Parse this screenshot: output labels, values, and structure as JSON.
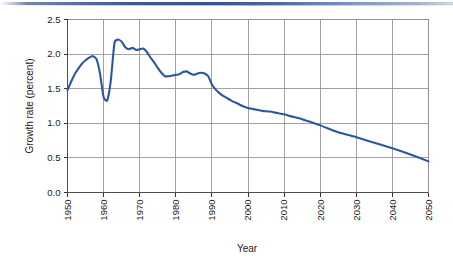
{
  "figure": {
    "background_color": "#ffffff",
    "top_rule_color": "#2f5490",
    "line_color": "#2b57a0",
    "grid_color": "#8c8c8c",
    "axis_color": "#4d4d4d"
  },
  "chart_data": {
    "type": "line",
    "title": "",
    "xlabel": "Year",
    "ylabel": "Growth rate (percent)",
    "xlim": [
      1950,
      2050
    ],
    "ylim": [
      0.0,
      2.5
    ],
    "grid": true,
    "legend": "none",
    "xticks": [
      1950,
      1960,
      1970,
      1980,
      1990,
      2000,
      2010,
      2020,
      2030,
      2040,
      2050
    ],
    "xtick_labels": [
      "1950",
      "1960",
      "1970",
      "1980",
      "1990",
      "2000",
      "2010",
      "2020",
      "2030",
      "2040",
      "2050"
    ],
    "xtick_label_rotation": 90,
    "yticks": [
      0.0,
      0.5,
      1.0,
      1.5,
      2.0,
      2.5
    ],
    "ytick_labels": [
      "0.0",
      "0.5",
      "1.0",
      "1.5",
      "2.0",
      "2.5"
    ],
    "series": [
      {
        "name": "Growth rate",
        "color": "#2b57a0",
        "x": [
          1950,
          1951,
          1952,
          1953,
          1954,
          1955,
          1956,
          1957,
          1958,
          1959,
          1960,
          1961,
          1962,
          1963,
          1964,
          1965,
          1966,
          1967,
          1968,
          1969,
          1970,
          1971,
          1972,
          1973,
          1974,
          1975,
          1976,
          1977,
          1978,
          1979,
          1980,
          1981,
          1982,
          1983,
          1984,
          1985,
          1986,
          1987,
          1988,
          1989,
          1990,
          1991,
          1992,
          1993,
          1994,
          1995,
          1996,
          1997,
          1998,
          1999,
          2000,
          2002,
          2004,
          2006,
          2008,
          2010,
          2012,
          2015,
          2020,
          2025,
          2030,
          2035,
          2040,
          2045,
          2050
        ],
        "y": [
          1.48,
          1.6,
          1.71,
          1.79,
          1.86,
          1.91,
          1.95,
          1.97,
          1.93,
          1.72,
          1.38,
          1.33,
          1.62,
          2.16,
          2.21,
          2.18,
          2.1,
          2.07,
          2.09,
          2.06,
          2.07,
          2.08,
          2.03,
          1.95,
          1.88,
          1.8,
          1.73,
          1.68,
          1.68,
          1.69,
          1.7,
          1.71,
          1.74,
          1.75,
          1.72,
          1.7,
          1.72,
          1.73,
          1.72,
          1.68,
          1.56,
          1.49,
          1.44,
          1.4,
          1.37,
          1.34,
          1.31,
          1.29,
          1.26,
          1.24,
          1.22,
          1.2,
          1.18,
          1.17,
          1.15,
          1.13,
          1.1,
          1.06,
          0.97,
          0.87,
          0.8,
          0.72,
          0.64,
          0.55,
          0.45
        ]
      }
    ]
  }
}
